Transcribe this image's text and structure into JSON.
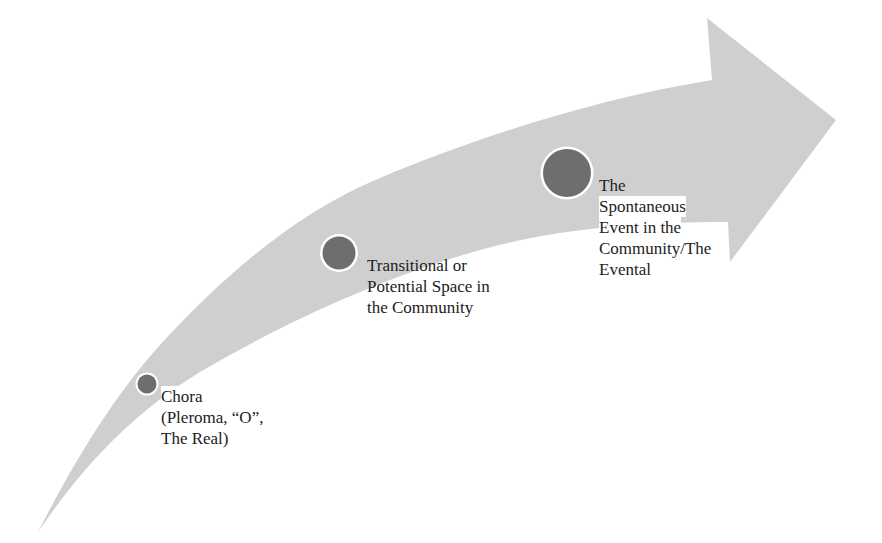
{
  "diagram": {
    "type": "curved-progression-arrow",
    "colors": {
      "arrow_fill": "#cfcfcf",
      "node_fill": "#6e6e6e",
      "node_ring": "#ffffff",
      "text": "#222222",
      "background": "#ffffff"
    },
    "stages": [
      {
        "id": "chora",
        "size": "small",
        "lines": [
          "Chora",
          "(Pleroma, “O”,",
          "The Real)"
        ]
      },
      {
        "id": "transitional",
        "size": "medium",
        "lines": [
          "Transitional or",
          "Potential Space in",
          "the Community"
        ]
      },
      {
        "id": "eventful",
        "size": "large",
        "lines": [
          "The",
          "Spontaneous",
          "Event in the",
          "Community/The",
          "Evental"
        ]
      }
    ]
  }
}
